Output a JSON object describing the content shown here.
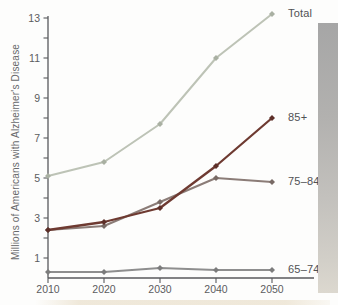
{
  "figure": {
    "background": "#fdfdfc",
    "axis_color": "#58595c",
    "tick_text_color": "#5b5c5e",
    "series_label_color": "#505154",
    "page_edge_gradient_top": "#a6a6a6",
    "page_edge_gradient_bottom": "#dcd8cf"
  },
  "chart_data": {
    "type": "line",
    "title": "",
    "xlabel": "",
    "ylabel": "Millions of Americans with Alzheimer's Disease",
    "x": [
      2010,
      2020,
      2030,
      2040,
      2050
    ],
    "x_tick_labels": [
      "2010",
      "2020",
      "2030",
      "2040",
      "2050"
    ],
    "ylim": [
      0,
      13
    ],
    "y_minor_tick_step": 1,
    "y_labeled_ticks": [
      1,
      3,
      5,
      7,
      9,
      11,
      13
    ],
    "grid": false,
    "legend_position": "right-end-labels",
    "series": [
      {
        "name": "Total",
        "values": [
          5.1,
          5.8,
          7.7,
          11.0,
          13.2
        ],
        "color": "#bdc3b6",
        "marker_color": "#a9b0a2"
      },
      {
        "name": "75–84",
        "values": [
          2.4,
          2.6,
          3.8,
          5.0,
          4.8
        ],
        "color": "#8b7c77",
        "marker_color": "#786a65"
      },
      {
        "name": "85+",
        "values": [
          2.4,
          2.8,
          3.5,
          5.6,
          8.0
        ],
        "color": "#6e3a31",
        "marker_color": "#5d2f28"
      },
      {
        "name": "65–74",
        "values": [
          0.3,
          0.3,
          0.5,
          0.4,
          0.4
        ],
        "color": "#8e8e8e",
        "marker_color": "#7c7c7c"
      }
    ]
  }
}
